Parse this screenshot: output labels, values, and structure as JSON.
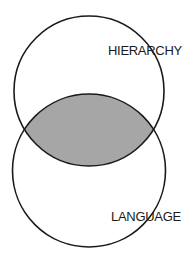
{
  "diagram": {
    "type": "venn",
    "sets": [
      {
        "label": "HIERARCHY",
        "position": "top"
      },
      {
        "label": "LANGUAGE",
        "position": "bottom"
      }
    ],
    "intersection": {
      "shaded": true,
      "fill": "#a6a6a6"
    },
    "stroke": "#1a1a1a",
    "background": "#ffffff"
  }
}
